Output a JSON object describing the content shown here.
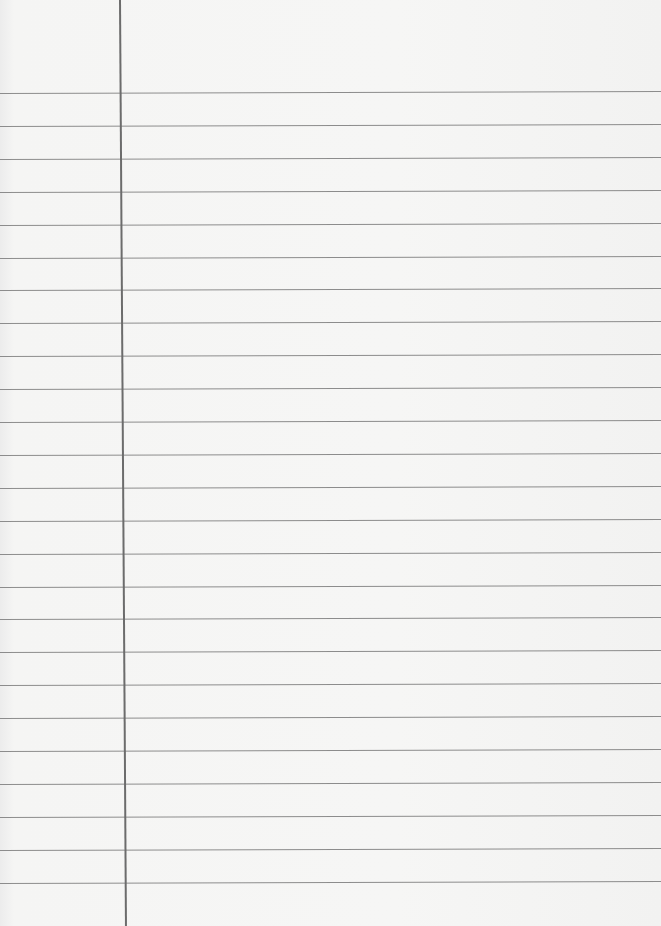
{
  "page": {
    "type": "lined-paper",
    "background_color": "#f3f3f2",
    "rule_color": "#8c8c8c",
    "margin_line_color": "#6c6c6c",
    "margin_line_x": 119,
    "rule_count": 25,
    "first_rule_y": 93,
    "rule_spacing": 32.9
  }
}
